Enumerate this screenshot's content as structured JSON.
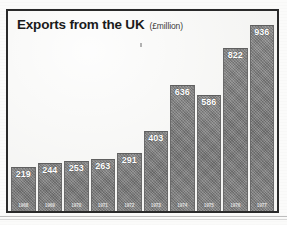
{
  "chart_data": {
    "type": "bar",
    "title": "Exports from the UK",
    "units_label": "(£million)",
    "xlabel": "",
    "ylabel": "£million",
    "ylim": [
      0,
      936
    ],
    "grid": false,
    "legend": "none",
    "categories": [
      "1968",
      "1969",
      "1970",
      "1971",
      "1972",
      "1973",
      "1974",
      "1975",
      "1976",
      "1977"
    ],
    "values": [
      219,
      244,
      253,
      263,
      291,
      403,
      636,
      586,
      822,
      936
    ],
    "value_labels": [
      "219",
      "244",
      "253",
      "263",
      "291",
      "403",
      "636",
      "586",
      "822",
      "936"
    ],
    "series": [
      {
        "name": "Exports from the UK",
        "values": [
          219,
          244,
          253,
          263,
          291,
          403,
          636,
          586,
          822,
          936
        ]
      }
    ]
  },
  "style": {
    "bar_color": "#7f7f7f",
    "frame_color": "#2a2a2a",
    "background_color": "#f4f4f2",
    "value_label_color": "#ffffff",
    "title_color": "#1b1b1b"
  }
}
